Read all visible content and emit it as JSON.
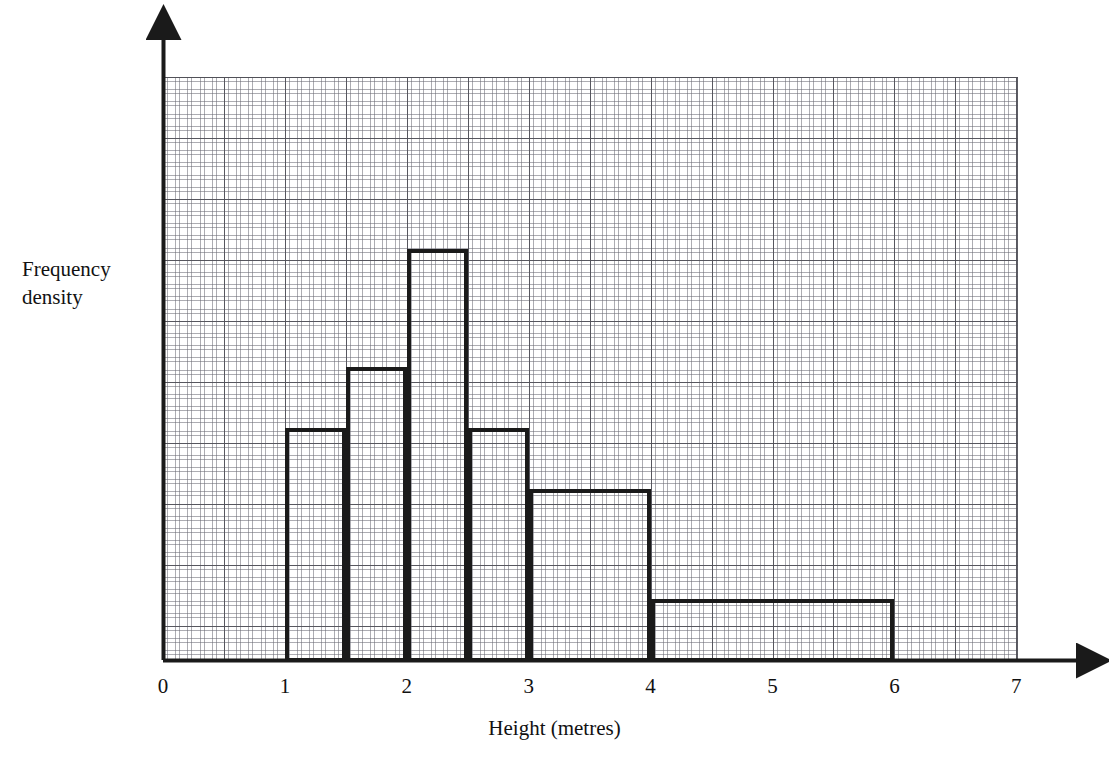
{
  "chart_data": {
    "type": "bar",
    "title": "",
    "subtitle": "",
    "xlabel": "Height (metres)",
    "ylabel": "Frequency density",
    "ylabel_lines": [
      "Frequency",
      "density"
    ],
    "grid": true,
    "grid_style": "graph-paper (major 1 unit, 5 minor subdivisions)",
    "legend": "none",
    "xlim": [
      0,
      7
    ],
    "ylim": [
      0,
      9.63
    ],
    "xticks": [
      0,
      1,
      2,
      3,
      4,
      5,
      6,
      7
    ],
    "xtick_labels": [
      "0",
      "1",
      "2",
      "3",
      "4",
      "5",
      "6",
      "7"
    ],
    "yticks": [],
    "ytick_labels": [],
    "x_units_per_major_gridline": 0.5,
    "y_units_per_major_gridline": 1,
    "bin_edges": [
      1,
      1.5,
      2,
      2.5,
      3,
      4,
      6
    ],
    "categories": [
      "1–1.5",
      "1.5–2",
      "2–2.5",
      "2.5–3",
      "3–4",
      "4–6"
    ],
    "values": [
      3.8,
      4.8,
      6.75,
      3.8,
      2.8,
      1.0
    ],
    "bars": [
      {
        "label": "1-1.5",
        "x0": 1,
        "x1": 1.5,
        "height": 3.8
      },
      {
        "label": "1.5-2",
        "x0": 1.5,
        "x1": 2,
        "height": 4.8
      },
      {
        "label": "2-2.5",
        "x0": 2,
        "x1": 2.5,
        "height": 6.75
      },
      {
        "label": "2.5-3",
        "x0": 2.5,
        "x1": 3,
        "height": 3.8
      },
      {
        "label": "3-4",
        "x0": 3,
        "x1": 4,
        "height": 2.8
      },
      {
        "label": "4-6",
        "x0": 4,
        "x1": 6,
        "height": 1.0
      }
    ],
    "colors": {
      "bar_outline": "#1a1a1a",
      "bar_fill": "transparent",
      "axis": "#1a1a1a",
      "grid_major": "#50505 8",
      "grid_minor": "#696973",
      "background": "#ffffff",
      "text": "#111111"
    }
  },
  "axes": {
    "x_axis_name": "x-axis",
    "y_axis_name": "y-axis",
    "arrowheads": true
  }
}
